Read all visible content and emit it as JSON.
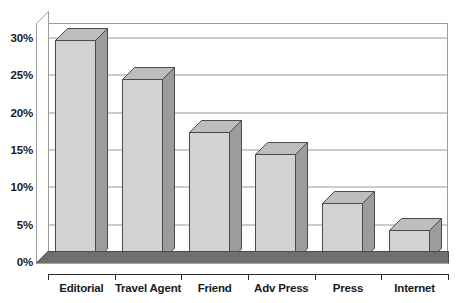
{
  "chart_data": {
    "type": "bar",
    "title": "",
    "subtitle": "",
    "xlabel": "",
    "ylabel": "",
    "categories": [
      "Editorial",
      "Travel Agent",
      "Friend",
      "Adv Press",
      "Press",
      "Internet"
    ],
    "values": [
      29.5,
      24.2,
      17.2,
      14.2,
      7.6,
      4.0
    ],
    "ylim": [
      0,
      32
    ],
    "yticks": [
      0,
      5,
      10,
      15,
      20,
      25,
      30
    ],
    "ytick_labels": [
      "0%",
      "5%",
      "10%",
      "15%",
      "20%",
      "25%",
      "30%"
    ],
    "grid": true,
    "legend": false,
    "legend_position": "none",
    "style": "3d-column",
    "colors": {
      "bar_front": "#d2d2d2",
      "bar_side": "#9c9c9c",
      "bar_top": "#bdbdbd",
      "bar_outline": "#4a4a4a",
      "gridline": "#9a9a9a",
      "axis": "#2b2b2b",
      "floor": "#707070",
      "floor_front": "#555555",
      "background": "#ffffff",
      "text": "#1a1a1a"
    }
  }
}
